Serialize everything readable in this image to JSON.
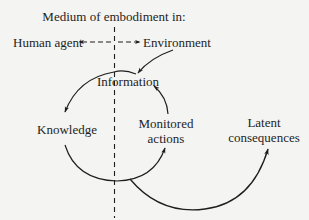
{
  "diagram": {
    "title": "Medium of embodiment in:",
    "nodes": {
      "human_agent": "Human agent",
      "environment": "Environment",
      "information": "Information",
      "knowledge": "Knowledge",
      "monitored_actions_line1": "Monitored",
      "monitored_actions_line2": "actions",
      "latent_consequences_line1": "Latent",
      "latent_consequences_line2": "consequences"
    },
    "edges": [
      {
        "from": "Environment",
        "to": "Information"
      },
      {
        "from": "Information",
        "to": "Knowledge"
      },
      {
        "from": "Knowledge",
        "to": "Monitored actions"
      },
      {
        "from": "Monitored actions",
        "to": "Information"
      },
      {
        "from": "Knowledge",
        "to": "Latent consequences"
      }
    ],
    "divider": "Dashed vertical line separating human agent (left) from environment (right)",
    "colors": {
      "background": "#f4f4f2",
      "ink": "#1e1e1e"
    }
  }
}
